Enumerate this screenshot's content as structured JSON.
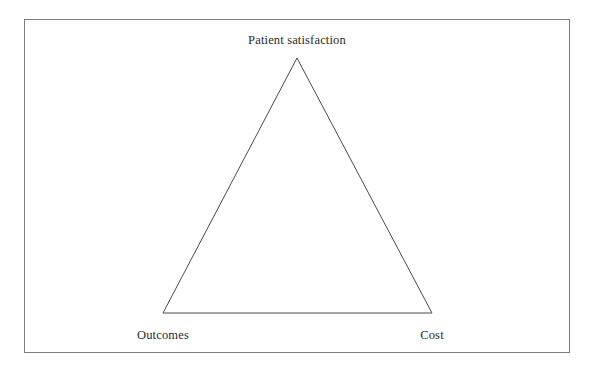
{
  "figure": {
    "background_color": "#ffffff",
    "frame": {
      "border_color": "#7d7d7d",
      "fill_color": "#ffffff"
    },
    "stroke_color": "#4a4a4a",
    "text_color": "#2b2b2b"
  },
  "diagram": {
    "type": "triangle",
    "shape_name": "iron-triangle",
    "vertices": {
      "apex": {
        "label": "Patient satisfaction",
        "x": 297,
        "y": 58
      },
      "bottom_left": {
        "label": "Outcomes",
        "x": 163,
        "y": 313
      },
      "bottom_right": {
        "label": "Cost",
        "x": 432,
        "y": 313
      }
    },
    "edges": [
      {
        "name": "left-edge",
        "from": "bottom_left",
        "to": "apex"
      },
      {
        "name": "right-edge",
        "from": "apex",
        "to": "bottom_right"
      },
      {
        "name": "base-edge",
        "from": "bottom_left",
        "to": "bottom_right"
      }
    ]
  }
}
